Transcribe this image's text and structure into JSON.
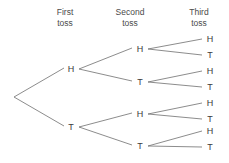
{
  "diagram": {
    "type": "probability-tree",
    "title": "",
    "background_color": "#ffffff",
    "line_color": "#6f6f6f",
    "text_color": "#3a3a3a",
    "headers": [
      {
        "line1": "First",
        "line2": "toss"
      },
      {
        "line1": "Second",
        "line2": "toss"
      },
      {
        "line1": "Third",
        "line2": "toss"
      }
    ],
    "levels": {
      "first": [
        {
          "label": "H"
        },
        {
          "label": "T"
        }
      ],
      "second": [
        {
          "label": "H"
        },
        {
          "label": "T"
        },
        {
          "label": "H"
        },
        {
          "label": "T"
        }
      ],
      "third": [
        {
          "label": "H"
        },
        {
          "label": "T"
        },
        {
          "label": "H"
        },
        {
          "label": "T"
        },
        {
          "label": "H"
        },
        {
          "label": "T"
        },
        {
          "label": "H"
        },
        {
          "label": "T"
        }
      ]
    }
  }
}
